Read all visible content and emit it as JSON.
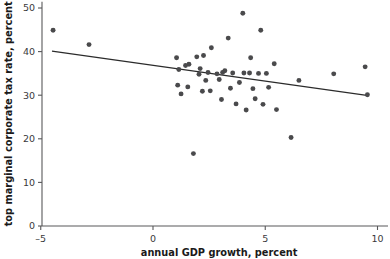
{
  "chart_data": {
    "type": "scatter",
    "title": "",
    "xlabel": "annual GDP growth, percent",
    "ylabel": "top marginal corporate tax rate, percent",
    "xlim": [
      -5.8,
      10.4
    ],
    "ylim": [
      0,
      51
    ],
    "xticks": [
      -5,
      0,
      5,
      10
    ],
    "xtick_labels": [
      "–5",
      "0",
      "5",
      "10"
    ],
    "yticks": [
      0,
      10,
      20,
      30,
      40,
      50
    ],
    "ytick_labels": [
      "0",
      "10",
      "20",
      "30",
      "40",
      "50"
    ],
    "grid": false,
    "legend": "none",
    "marker_color": "#4a4a4c",
    "line_color": "#2b2b2b",
    "axis_color": "#58585a",
    "trendline": {
      "label": "linear fit",
      "x_start": -4.5,
      "y_start": 40.1,
      "x_end": 9.6,
      "y_end": 29.9
    },
    "points": [
      {
        "x": -4.45,
        "y": 44.9
      },
      {
        "x": -2.85,
        "y": 41.6
      },
      {
        "x": 1.05,
        "y": 38.6
      },
      {
        "x": 1.1,
        "y": 32.3
      },
      {
        "x": 1.15,
        "y": 35.9
      },
      {
        "x": 1.25,
        "y": 30.3
      },
      {
        "x": 1.45,
        "y": 36.8
      },
      {
        "x": 1.55,
        "y": 31.9
      },
      {
        "x": 1.6,
        "y": 37.1
      },
      {
        "x": 1.8,
        "y": 16.6
      },
      {
        "x": 1.95,
        "y": 38.8
      },
      {
        "x": 2.05,
        "y": 34.8
      },
      {
        "x": 2.1,
        "y": 36.1
      },
      {
        "x": 2.2,
        "y": 30.9
      },
      {
        "x": 2.25,
        "y": 39.1
      },
      {
        "x": 2.35,
        "y": 33.4
      },
      {
        "x": 2.45,
        "y": 35.2
      },
      {
        "x": 2.55,
        "y": 31.0
      },
      {
        "x": 2.6,
        "y": 40.9
      },
      {
        "x": 2.85,
        "y": 34.9
      },
      {
        "x": 2.95,
        "y": 33.6
      },
      {
        "x": 3.05,
        "y": 29.0
      },
      {
        "x": 3.1,
        "y": 35.2
      },
      {
        "x": 3.2,
        "y": 35.6
      },
      {
        "x": 3.35,
        "y": 43.1
      },
      {
        "x": 3.45,
        "y": 31.6
      },
      {
        "x": 3.55,
        "y": 35.1
      },
      {
        "x": 3.7,
        "y": 28.0
      },
      {
        "x": 3.85,
        "y": 32.9
      },
      {
        "x": 4.0,
        "y": 48.8
      },
      {
        "x": 4.05,
        "y": 35.1
      },
      {
        "x": 4.15,
        "y": 26.6
      },
      {
        "x": 4.3,
        "y": 35.1
      },
      {
        "x": 4.35,
        "y": 38.6
      },
      {
        "x": 4.45,
        "y": 31.5
      },
      {
        "x": 4.55,
        "y": 29.2
      },
      {
        "x": 4.7,
        "y": 35.0
      },
      {
        "x": 4.8,
        "y": 44.9
      },
      {
        "x": 4.9,
        "y": 27.9
      },
      {
        "x": 5.05,
        "y": 35.0
      },
      {
        "x": 5.15,
        "y": 31.8
      },
      {
        "x": 5.4,
        "y": 37.2
      },
      {
        "x": 5.5,
        "y": 26.7
      },
      {
        "x": 6.15,
        "y": 20.3
      },
      {
        "x": 6.5,
        "y": 33.4
      },
      {
        "x": 8.05,
        "y": 34.9
      },
      {
        "x": 9.45,
        "y": 36.5
      },
      {
        "x": 9.55,
        "y": 30.1
      }
    ]
  }
}
